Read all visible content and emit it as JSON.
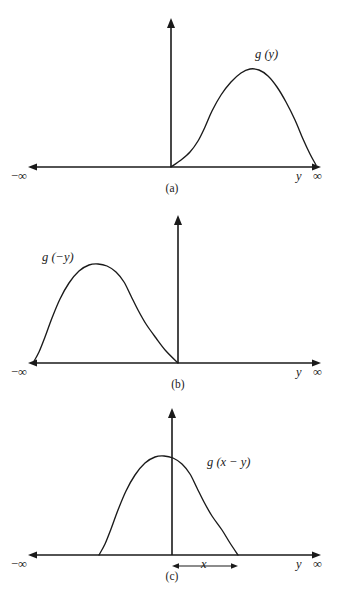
{
  "figure": {
    "background": "#ffffff",
    "ink": "#1a1a1a",
    "panels": [
      {
        "id": "a",
        "caption": "(a)",
        "curve_label": "g (y)",
        "left_axis_label": "−∞",
        "right_axis_label": "∞",
        "variable_label": "y",
        "description": "g(y) plotted for positive y, rising from the origin to a peak then falling back to the axis"
      },
      {
        "id": "b",
        "caption": "(b)",
        "curve_label": "g (−y)",
        "left_axis_label": "−∞",
        "right_axis_label": "∞",
        "variable_label": "y",
        "description": "g(-y) is the mirror reflection of g(y) about the vertical axis, occupying negative y"
      },
      {
        "id": "c",
        "caption": "(c)",
        "curve_label": "g (x − y)",
        "left_axis_label": "−∞",
        "right_axis_label": "∞",
        "variable_label": "y",
        "shift_label": "x",
        "description": "g(x-y) is g(-y) shifted to the right by the amount x, indicated by a double headed arrow"
      }
    ]
  },
  "chart_data": {
    "type": "line",
    "title": "",
    "xlabel": "y",
    "ylabel": "",
    "grid": false,
    "legend": null,
    "panel_geometry": {
      "axis_x_left_px": 28,
      "axis_x_right_px": 321,
      "vertical_axis_arrow_gap_px": 12
    },
    "panels": [
      {
        "id": "a",
        "label": "g (y)",
        "baseline_y_px": 167,
        "origin_x_px": 171,
        "vaxis_top_px": 18,
        "caption_y_px": 183,
        "label_x_px": 255,
        "label_y_px": 55,
        "curve_points": [
          [
            171,
            167
          ],
          [
            181,
            160
          ],
          [
            190,
            152
          ],
          [
            198,
            141
          ],
          [
            205,
            127
          ],
          [
            212,
            111
          ],
          [
            221,
            95
          ],
          [
            231,
            82
          ],
          [
            241,
            73
          ],
          [
            250,
            69
          ],
          [
            259,
            70
          ],
          [
            268,
            76
          ],
          [
            277,
            87
          ],
          [
            286,
            102
          ],
          [
            295,
            120
          ],
          [
            303,
            139
          ],
          [
            310,
            154
          ],
          [
            316,
            165
          ]
        ],
        "peak_px": [
          253,
          68
        ],
        "support_px": [
          171,
          317
        ]
      },
      {
        "id": "b",
        "label": "g (−y)",
        "baseline_y_px": 363,
        "origin_x_px": 178,
        "vaxis_top_px": 215,
        "caption_y_px": 379,
        "label_x_px": 44,
        "label_y_px": 258,
        "curve_points": [
          [
            33,
            363
          ],
          [
            39,
            352
          ],
          [
            45,
            337
          ],
          [
            52,
            318
          ],
          [
            60,
            299
          ],
          [
            69,
            283
          ],
          [
            79,
            271
          ],
          [
            89,
            265
          ],
          [
            98,
            264
          ],
          [
            107,
            266
          ],
          [
            116,
            272
          ],
          [
            124,
            282
          ],
          [
            131,
            296
          ],
          [
            138,
            310
          ],
          [
            146,
            324
          ],
          [
            156,
            338
          ],
          [
            166,
            351
          ],
          [
            178,
            363
          ]
        ],
        "peak_px": [
          100,
          264
        ],
        "support_px": [
          33,
          178
        ]
      },
      {
        "id": "c",
        "label": "g (x − y)",
        "baseline_y_px": 555,
        "origin_x_px": 172,
        "vaxis_top_px": 408,
        "caption_y_px": 571,
        "label_x_px": 207,
        "label_y_px": 463,
        "shift_arrow": {
          "from_x_px": 172,
          "to_x_px": 238,
          "y_px": 566,
          "label": "x",
          "label_x_px": 200,
          "label_y_px": 559
        },
        "curve_points": [
          [
            99,
            555
          ],
          [
            105,
            544
          ],
          [
            111,
            529
          ],
          [
            118,
            510
          ],
          [
            126,
            491
          ],
          [
            135,
            475
          ],
          [
            145,
            463
          ],
          [
            155,
            457
          ],
          [
            164,
            456
          ],
          [
            173,
            458
          ],
          [
            182,
            464
          ],
          [
            190,
            474
          ],
          [
            197,
            488
          ],
          [
            204,
            502
          ],
          [
            212,
            516
          ],
          [
            222,
            530
          ],
          [
            230,
            543
          ],
          [
            238,
            555
          ]
        ],
        "peak_px": [
          166,
          456
        ],
        "support_px": [
          99,
          238
        ]
      }
    ]
  }
}
